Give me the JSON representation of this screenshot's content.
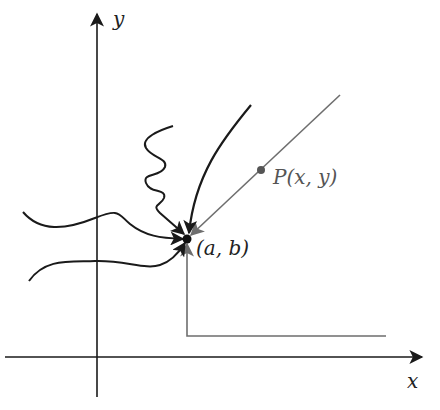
{
  "diagram": {
    "axes": {
      "x_label": "x",
      "y_label": "y"
    },
    "points": {
      "limit_point": {
        "label": "(a, b)"
      },
      "moving_point": {
        "label": "P(x, y)"
      }
    },
    "paths": [
      {
        "name": "wavy-upper-left",
        "style": "black curve"
      },
      {
        "name": "wavy-lower-left",
        "style": "black curve"
      },
      {
        "name": "squiggle-from-top",
        "style": "black zigzag"
      },
      {
        "name": "curve-from-upper-right",
        "style": "black curve"
      },
      {
        "name": "straight-line-through-P",
        "style": "gray line"
      },
      {
        "name": "l-shaped-from-lower-right",
        "style": "gray polyline"
      }
    ],
    "colors": {
      "black": "#1a1a1a",
      "gray": "#6e6e6e"
    }
  }
}
